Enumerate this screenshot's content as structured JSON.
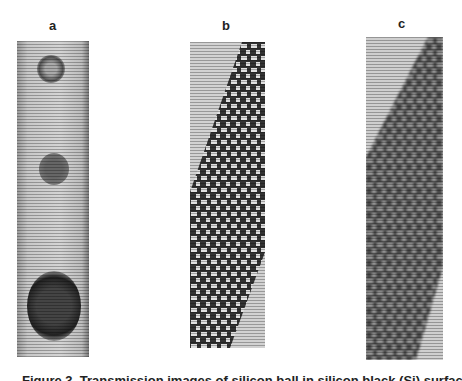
{
  "figure": {
    "panels": [
      {
        "label": "a",
        "description": "transmission image with three dark circular spots"
      },
      {
        "label": "b",
        "description": "hexagonal lattice pattern, diagonal boundary"
      },
      {
        "label": "c",
        "description": "blurred hexagonal lattice pattern, diagonal boundary"
      }
    ],
    "caption": "Figure 3. Transmission images of silicon ball in silicon black (Si) surface of crystal"
  },
  "colors": {
    "background": "#ffffff",
    "panel_gray": "#d0d0d0",
    "dark": "#2a2a2a"
  }
}
